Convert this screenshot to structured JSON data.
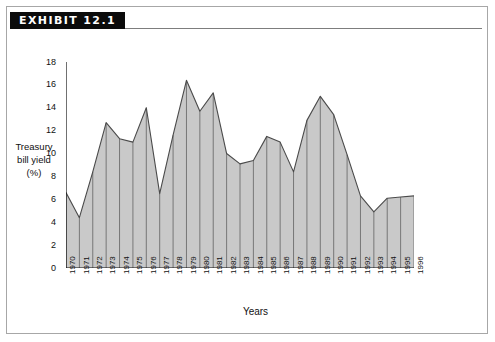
{
  "exhibit": {
    "tag_label": "EXHIBIT 12.1"
  },
  "chart_data": {
    "type": "area",
    "title": "",
    "xlabel": "Years",
    "ylabel": "Treasury bill yield (%)",
    "ylabel_lines": [
      "Treasury",
      "bill yield",
      "(%)"
    ],
    "ylim": [
      0,
      18
    ],
    "ytick_step": 2,
    "yticks": [
      0,
      2,
      4,
      6,
      8,
      10,
      12,
      14,
      16,
      18
    ],
    "grid": false,
    "legend": null,
    "fill_color": "#c9c9c9",
    "line_color": "#4a4a4a",
    "axis_color": "#111111",
    "categories": [
      "1970",
      "1971",
      "1972",
      "1973",
      "1974",
      "1975",
      "1976",
      "1977",
      "1978",
      "1979",
      "1980",
      "1981",
      "1982",
      "1983",
      "1984",
      "1985",
      "1986",
      "1987",
      "1988",
      "1989",
      "1990",
      "1991",
      "1992",
      "1993",
      "1994",
      "1995",
      "1996"
    ],
    "values": [
      6.6,
      4.4,
      8.4,
      12.7,
      11.3,
      11.0,
      14.0,
      6.5,
      11.6,
      16.4,
      13.7,
      15.3,
      10.0,
      9.1,
      9.4,
      11.5,
      11.0,
      8.4,
      12.9,
      15.0,
      13.4,
      9.9,
      6.3,
      4.9,
      6.1,
      6.2,
      6.3
    ]
  }
}
